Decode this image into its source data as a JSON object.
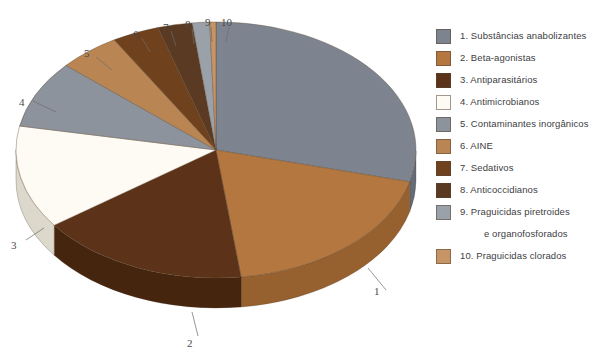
{
  "chart_data": {
    "type": "pie",
    "title": "",
    "subtitle": "",
    "xlabel": "",
    "ylabel": "",
    "style": "3d-exploded-depth",
    "legend_position": "right",
    "grid": false,
    "categories": [
      "1. Substâncias anabolizantes",
      "2. Beta-agonistas",
      "3. Antiparasitários",
      "4. Antimicrobianos",
      "5. Contaminantes inorgânicos",
      "6. AINE",
      "7. Sedativos",
      "8. Anticoccidianos",
      "9. Praguicidas piretroides e organofosforados",
      "10. Praguicidas clorados"
    ],
    "values": [
      29.0,
      19.0,
      17.0,
      13.0,
      8.5,
      5.0,
      3.8,
      2.8,
      1.4,
      0.5
    ],
    "colors": [
      "#7d8490",
      "#b3773f",
      "#5c3318",
      "#fdfbf4",
      "#8d939c",
      "#b98553",
      "#70411d",
      "#5a3a22",
      "#9aa1a9",
      "#c79465"
    ],
    "side_colors": [
      "#666c77",
      "#96612f",
      "#46250f",
      "#ddd8cc",
      "#737a83",
      "#9a6c40",
      "#5a3315",
      "#462c19",
      "#7d848c",
      "#a87b51"
    ]
  },
  "callouts": {
    "items": [
      {
        "label": "1"
      },
      {
        "label": "2"
      },
      {
        "label": "3"
      },
      {
        "label": "4"
      },
      {
        "label": "5"
      },
      {
        "label": "6"
      },
      {
        "label": "7"
      },
      {
        "label": "8"
      },
      {
        "label": "9"
      },
      {
        "label": "10"
      }
    ]
  },
  "legend": {
    "entries": [
      {
        "label": "1. Substâncias anabolizantes",
        "color": "#7d8490"
      },
      {
        "label": "2. Beta-agonistas",
        "color": "#b3773f"
      },
      {
        "label": "3. Antiparasitários",
        "color": "#5c3318"
      },
      {
        "label": "4. Antimicrobianos",
        "color": "#fdfbf4"
      },
      {
        "label": "5. Contaminantes inorgânicos",
        "color": "#8d939c"
      },
      {
        "label": "6. AINE",
        "color": "#b98553"
      },
      {
        "label": "7. Sedativos",
        "color": "#70411d"
      },
      {
        "label": "8. Anticoccidianos",
        "color": "#5a3a22"
      },
      {
        "label": "9. Praguicidas piretroides",
        "color": "#9aa1a9"
      },
      {
        "label": "e organofosforados",
        "color": null
      },
      {
        "label": "10. Praguicidas clorados",
        "color": "#c79465"
      }
    ]
  }
}
